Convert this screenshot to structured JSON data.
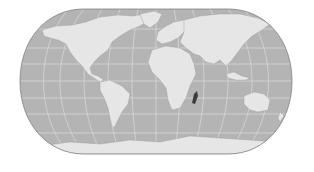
{
  "map": {
    "projection": "eckert-iv-like",
    "style": "grayscale",
    "highlighted_region": "Madagascar",
    "colors": {
      "background": "#ffffff",
      "ocean": "#b4b4b4",
      "land": "#e6e6e6",
      "graticule": "#dcdcdc",
      "highlight": "#3c3c3c",
      "border": "#808080"
    }
  }
}
